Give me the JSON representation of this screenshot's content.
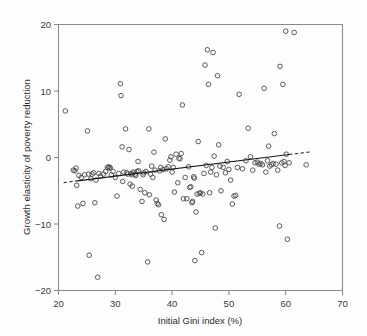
{
  "figure": {
    "background": "#fdfdfd",
    "point_color": "#4a4a4a",
    "line_color": "#1a1a1a",
    "axis_color": "#8a8a8a"
  },
  "chart_data": {
    "type": "scatter",
    "title": "",
    "xlabel": "Initial Gini index (%)",
    "ylabel": "Growth elasticity of poverty reduction",
    "xlim": [
      20,
      70
    ],
    "ylim": [
      -20,
      20
    ],
    "xticks": [
      20,
      30,
      40,
      50,
      60,
      70
    ],
    "yticks": [
      -20,
      -10,
      0,
      10,
      20
    ],
    "xtick_labels": [
      "20",
      "30",
      "40",
      "50",
      "60",
      "70"
    ],
    "ytick_labels": [
      "−20",
      "−10",
      "0",
      "10",
      "20"
    ],
    "grid": false,
    "legend": null,
    "marker": "open-circle",
    "trendline": {
      "style_solid": "solid",
      "style_extension": "dashed",
      "solid_x": [
        23.0,
        60.6
      ],
      "solid_y": [
        -3.55,
        0.45
      ],
      "dash_left_x": [
        20.9,
        23.0
      ],
      "dash_left_y": [
        -3.78,
        -3.55
      ],
      "dash_right_x": [
        60.6,
        64.3
      ],
      "dash_right_y": [
        0.45,
        0.84
      ],
      "slope": 0.106,
      "intercept": -6.0
    },
    "points": [
      [
        21.2,
        7.0
      ],
      [
        22.6,
        -1.9
      ],
      [
        22.9,
        -2.0
      ],
      [
        23.1,
        -1.6
      ],
      [
        23.2,
        -4.2
      ],
      [
        23.4,
        -7.3
      ],
      [
        23.6,
        -2.7
      ],
      [
        24.0,
        -3.0
      ],
      [
        24.3,
        -6.9
      ],
      [
        24.6,
        -2.6
      ],
      [
        25.1,
        4.0
      ],
      [
        25.3,
        -2.5
      ],
      [
        25.4,
        -14.7
      ],
      [
        25.7,
        -3.2
      ],
      [
        25.9,
        -2.5
      ],
      [
        26.2,
        -2.3
      ],
      [
        26.4,
        -6.8
      ],
      [
        26.6,
        -3.4
      ],
      [
        26.9,
        -18.0
      ],
      [
        27.1,
        -2.4
      ],
      [
        27.4,
        -2.8
      ],
      [
        27.9,
        -2.5
      ],
      [
        28.3,
        -2.1
      ],
      [
        28.6,
        -1.5
      ],
      [
        28.8,
        -1.4
      ],
      [
        29.0,
        -1.6
      ],
      [
        29.1,
        -1.5
      ],
      [
        29.3,
        -2.6
      ],
      [
        29.6,
        -2.1
      ],
      [
        30.0,
        -3.0
      ],
      [
        30.3,
        -5.8
      ],
      [
        30.6,
        -2.4
      ],
      [
        30.9,
        11.1
      ],
      [
        31.0,
        9.3
      ],
      [
        31.2,
        1.6
      ],
      [
        31.3,
        -3.6
      ],
      [
        31.5,
        -2.2
      ],
      [
        31.8,
        4.3
      ],
      [
        32.0,
        -2.3
      ],
      [
        32.2,
        -2.5
      ],
      [
        32.4,
        1.2
      ],
      [
        32.6,
        -4.0
      ],
      [
        32.8,
        -2.4
      ],
      [
        32.9,
        -2.6
      ],
      [
        33.0,
        -4.3
      ],
      [
        33.2,
        -2.2
      ],
      [
        33.5,
        -2.5
      ],
      [
        33.6,
        -2.7
      ],
      [
        33.8,
        -2.1
      ],
      [
        34.0,
        -0.6
      ],
      [
        34.1,
        -2.0
      ],
      [
        34.4,
        -4.8
      ],
      [
        34.7,
        -6.6
      ],
      [
        34.9,
        -2.6
      ],
      [
        35.0,
        -2.3
      ],
      [
        35.2,
        -5.3
      ],
      [
        35.4,
        -2.1
      ],
      [
        35.7,
        -15.7
      ],
      [
        35.9,
        4.3
      ],
      [
        36.0,
        -5.6
      ],
      [
        36.2,
        -2.5
      ],
      [
        36.4,
        -1.3
      ],
      [
        36.6,
        -3.0
      ],
      [
        36.8,
        0.8
      ],
      [
        37.0,
        -1.9
      ],
      [
        37.2,
        -6.4
      ],
      [
        37.4,
        -6.9
      ],
      [
        37.6,
        -7.1
      ],
      [
        37.8,
        -2.0
      ],
      [
        38.0,
        -1.5
      ],
      [
        38.1,
        -8.6
      ],
      [
        38.4,
        -1.8
      ],
      [
        38.6,
        -9.3
      ],
      [
        38.8,
        2.8
      ],
      [
        39.0,
        -1.7
      ],
      [
        39.3,
        -1.4
      ],
      [
        39.6,
        -0.4
      ],
      [
        39.8,
        0.1
      ],
      [
        40.0,
        -2.2
      ],
      [
        40.2,
        -1.5
      ],
      [
        40.4,
        -5.2
      ],
      [
        40.7,
        0.5
      ],
      [
        41.0,
        -3.8
      ],
      [
        41.2,
        -0.1
      ],
      [
        41.4,
        -0.2
      ],
      [
        41.6,
        0.6
      ],
      [
        41.8,
        7.9
      ],
      [
        42.0,
        -6.2
      ],
      [
        42.3,
        -3.0
      ],
      [
        42.6,
        -6.2
      ],
      [
        42.9,
        -1.4
      ],
      [
        43.1,
        -4.5
      ],
      [
        43.3,
        -4.4
      ],
      [
        43.5,
        -6.8
      ],
      [
        43.6,
        -6.6
      ],
      [
        43.8,
        -2.9
      ],
      [
        43.9,
        -3.1
      ],
      [
        44.0,
        -15.5
      ],
      [
        44.2,
        -8.2
      ],
      [
        44.4,
        -5.5
      ],
      [
        44.6,
        2.4
      ],
      [
        44.8,
        -5.4
      ],
      [
        45.0,
        -5.3
      ],
      [
        45.2,
        -14.3
      ],
      [
        45.4,
        -5.5
      ],
      [
        45.6,
        -2.4
      ],
      [
        45.8,
        13.9
      ],
      [
        46.0,
        -1.2
      ],
      [
        46.2,
        16.2
      ],
      [
        46.4,
        11.0
      ],
      [
        46.6,
        -5.3
      ],
      [
        46.8,
        -2.2
      ],
      [
        47.0,
        -1.5
      ],
      [
        47.2,
        15.8
      ],
      [
        47.4,
        0.2
      ],
      [
        47.6,
        -10.6
      ],
      [
        47.8,
        -2.6
      ],
      [
        48.0,
        12.3
      ],
      [
        48.2,
        1.9
      ],
      [
        48.4,
        -1.3
      ],
      [
        48.6,
        -5.0
      ],
      [
        49.0,
        -1.5
      ],
      [
        49.4,
        -2.3
      ],
      [
        49.7,
        -0.6
      ],
      [
        50.0,
        -1.8
      ],
      [
        50.3,
        -3.4
      ],
      [
        50.6,
        -7.0
      ],
      [
        50.9,
        -5.8
      ],
      [
        51.2,
        -5.7
      ],
      [
        51.5,
        -1.5
      ],
      [
        51.8,
        9.5
      ],
      [
        52.4,
        -1.7
      ],
      [
        53.0,
        -0.5
      ],
      [
        53.4,
        4.4
      ],
      [
        53.8,
        0.1
      ],
      [
        54.2,
        -1.9
      ],
      [
        54.6,
        -0.8
      ],
      [
        55.0,
        -0.7
      ],
      [
        55.3,
        -1.0
      ],
      [
        55.6,
        -0.9
      ],
      [
        55.9,
        -1.1
      ],
      [
        56.2,
        10.4
      ],
      [
        56.5,
        -2.2
      ],
      [
        56.8,
        -0.5
      ],
      [
        57.0,
        1.7
      ],
      [
        57.2,
        -1.3
      ],
      [
        57.5,
        -1.1
      ],
      [
        57.8,
        -0.9
      ],
      [
        58.0,
        3.6
      ],
      [
        58.3,
        -1.0
      ],
      [
        58.6,
        -1.9
      ],
      [
        58.9,
        -10.3
      ],
      [
        59.0,
        13.7
      ],
      [
        59.3,
        -0.8
      ],
      [
        59.5,
        11.0
      ],
      [
        59.7,
        -0.6
      ],
      [
        59.9,
        -1.2
      ],
      [
        60.0,
        19.0
      ],
      [
        60.1,
        0.5
      ],
      [
        60.3,
        -12.3
      ],
      [
        60.6,
        -0.8
      ],
      [
        61.5,
        18.8
      ],
      [
        63.6,
        -1.1
      ]
    ]
  }
}
